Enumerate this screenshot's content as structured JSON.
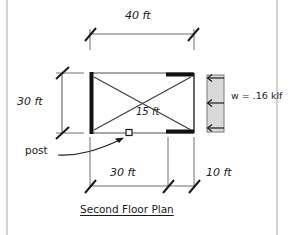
{
  "drawing": {
    "title": "Second Floor Plan",
    "labels": {
      "top_dimension": "40 ft",
      "left_dimension": "30 ft",
      "diagonal_dimension": "15 ft",
      "load_label": "w = .16 klf",
      "post_label": "post",
      "bottom_left_dimension": "30 ft",
      "bottom_right_dimension": "10 ft"
    },
    "dimensions": {
      "building_width_ft": 40,
      "building_depth_ft": 30,
      "interior_span_ft": 15,
      "bottom_segment_left_ft": 30,
      "bottom_segment_right_ft": 10
    },
    "load": {
      "symbol": "w",
      "magnitude": 0.16,
      "unit": "klf",
      "direction": "leftward",
      "arrow_count": 3
    },
    "elements": {
      "post_marker": "square",
      "bracing": "diagonal-cross",
      "walls_bold": [
        "left",
        "top-right",
        "bottom-right"
      ]
    },
    "colors": {
      "ink": "#1a1a1a",
      "thin_line": "#6f6f6f",
      "load_fill": "#d9d9d9",
      "border": "#aaaaaa",
      "background": "#ffffff"
    }
  }
}
